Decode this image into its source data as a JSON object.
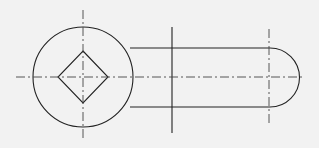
{
  "drawing": {
    "type": "orthographic-view",
    "description": "Lever/arm with circular boss containing square (diamond) hole and slotted rounded end",
    "features": [
      {
        "name": "circular-boss",
        "shape": "circle"
      },
      {
        "name": "square-hole",
        "shape": "square rotated 45 degrees"
      },
      {
        "name": "arm",
        "shape": "straight slot with semicircular end"
      },
      {
        "name": "section-line",
        "shape": "vertical solid line"
      }
    ],
    "line_color": "#222222",
    "background_color": "#f2f2f2"
  }
}
